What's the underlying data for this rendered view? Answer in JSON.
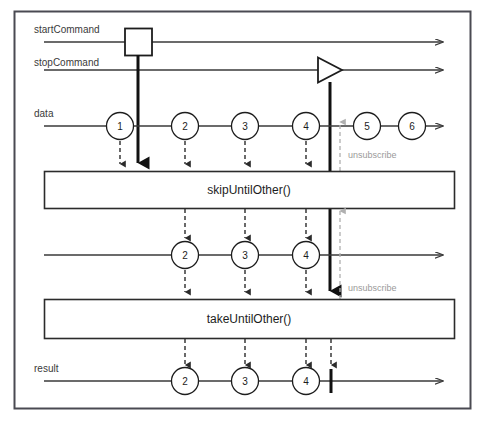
{
  "diagram": {
    "background_color": "#ffffff",
    "border_color": "#4a4a52",
    "line_color": "#3a3a3a",
    "bold_color": "#111111",
    "unsubscribe_color": "#b0b0b0",
    "text_color": "#3a3a3a"
  },
  "streams": {
    "start_command": {
      "label": "startCommand",
      "marker": "square",
      "marker_x": 138,
      "line_y": 42
    },
    "stop_command": {
      "label": "stopCommand",
      "marker": "triangle",
      "marker_x": 330,
      "line_y": 70
    },
    "data": {
      "label": "data",
      "line_y": 126,
      "marbles": [
        {
          "value": "1",
          "x": 120
        },
        {
          "value": "2",
          "x": 185
        },
        {
          "value": "3",
          "x": 245
        },
        {
          "value": "4",
          "x": 306
        },
        {
          "value": "5",
          "x": 367
        },
        {
          "value": "6",
          "x": 412
        }
      ]
    },
    "intermediate": {
      "label": "",
      "line_y": 255,
      "marbles": [
        {
          "value": "2",
          "x": 185
        },
        {
          "value": "3",
          "x": 245
        },
        {
          "value": "4",
          "x": 306
        }
      ]
    },
    "result": {
      "label": "result",
      "line_y": 381,
      "complete_x": 331,
      "marbles": [
        {
          "value": "2",
          "x": 185
        },
        {
          "value": "3",
          "x": 245
        },
        {
          "value": "4",
          "x": 306
        }
      ]
    }
  },
  "operators": [
    {
      "name": "skipUntilOther()",
      "y": 171,
      "height": 37
    },
    {
      "name": "takeUntilOther()",
      "y": 299,
      "height": 39
    }
  ],
  "unsubscribe_markers": [
    {
      "label": "unsubscribe",
      "x": 340,
      "text_x": 348,
      "text_y": 158,
      "arrow_top": 124,
      "arrow_bottom": 171
    },
    {
      "label": "unsubscribe",
      "x": 340,
      "text_x": 348,
      "text_y": 291,
      "arrow_top": 213,
      "arrow_bottom": 299
    }
  ]
}
